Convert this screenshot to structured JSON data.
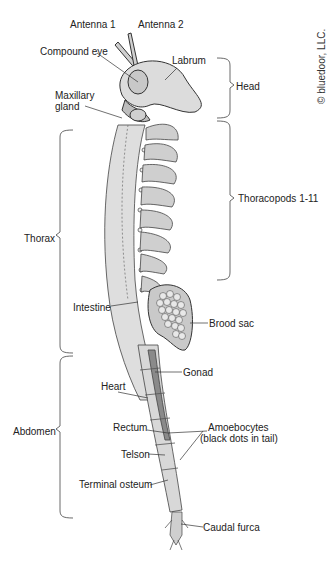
{
  "diagram": {
    "copyright": "© bluedoor, LLC.",
    "labels": {
      "antenna1": "Antenna 1",
      "antenna2": "Antenna 2",
      "compound_eye": "Compound eye",
      "labrum": "Labrum",
      "maxillary_gland_line1": "Maxillary",
      "maxillary_gland_line2": "gland",
      "intestine": "Intestine",
      "brood_sac": "Brood sac",
      "gonad": "Gonad",
      "heart": "Heart",
      "rectum": "Rectum",
      "amoebocytes_line1": "Amoebocytes",
      "amoebocytes_line2": "(black dots in tail)",
      "telson": "Telson",
      "terminal_osteum": "Terminal osteum",
      "caudal_furca": "Caudal furca"
    },
    "regions": {
      "head": "Head",
      "thoracopods": "Thoracopods 1-11",
      "thorax": "Thorax",
      "abdomen": "Abdomen"
    },
    "colors": {
      "body_fill": "#d9d9d9",
      "body_dark": "#9a9a9a",
      "gonad_fill": "#8a8a8a",
      "outline": "#333333",
      "background": "#ffffff"
    }
  }
}
